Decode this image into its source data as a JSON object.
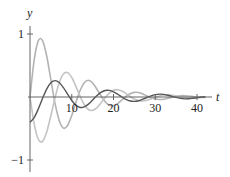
{
  "chart_data": {
    "type": "line",
    "title": "",
    "xlabel": "t",
    "ylabel": "y",
    "xlim": [
      0,
      42
    ],
    "ylim": [
      -1.05,
      1.15
    ],
    "grid": false,
    "legend": null,
    "x_ticks": [
      10,
      20,
      30,
      40
    ],
    "x_tick_labels": [
      "10",
      "20",
      "30",
      "40"
    ],
    "y_ticks": [
      1,
      -1
    ],
    "y_tick_labels": [
      "1",
      "−1"
    ],
    "x": [
      0,
      1,
      2,
      3,
      4,
      5,
      6,
      7,
      8,
      9,
      10,
      11,
      12,
      13,
      14,
      15,
      16,
      17,
      18,
      19,
      20,
      21,
      22,
      23,
      24,
      25,
      26,
      27,
      28,
      29,
      30,
      31,
      32,
      33,
      34,
      35,
      36,
      37,
      38,
      39,
      40,
      41,
      42
    ],
    "series": [
      {
        "name": "curve-light-1",
        "color": "#b3b3b3",
        "values": [
          0,
          0.586,
          0.894,
          0.896,
          0.651,
          0.275,
          -0.102,
          -0.372,
          -0.494,
          -0.452,
          -0.294,
          -0.087,
          0.104,
          0.226,
          0.265,
          0.222,
          0.128,
          0.019,
          -0.075,
          -0.131,
          -0.137,
          -0.105,
          -0.048,
          0.01,
          0.053,
          0.074,
          0.071,
          0.049,
          0.018,
          -0.012,
          -0.032,
          -0.04,
          -0.035,
          -0.021,
          -0.005,
          0.01,
          0.019,
          0.021,
          0.017,
          0.009,
          0.0,
          -0.005,
          -0.008
        ]
      },
      {
        "name": "curve-light-2",
        "color": "#c4c4c4",
        "values": [
          0,
          -0.427,
          -0.671,
          -0.704,
          -0.556,
          -0.297,
          -0.013,
          0.226,
          0.364,
          0.387,
          0.309,
          0.169,
          0.01,
          -0.12,
          -0.198,
          -0.212,
          -0.172,
          -0.096,
          -0.01,
          0.063,
          0.107,
          0.116,
          0.095,
          0.054,
          0.007,
          -0.033,
          -0.058,
          -0.064,
          -0.053,
          -0.031,
          -0.005,
          0.017,
          0.031,
          0.034,
          0.029,
          0.017,
          0.003,
          -0.009,
          -0.016,
          -0.018,
          -0.015,
          -0.009,
          -0.002
        ]
      },
      {
        "name": "curve-dark",
        "color": "#555555",
        "values": [
          -0.4,
          -0.327,
          -0.188,
          -0.023,
          0.126,
          0.226,
          0.26,
          0.229,
          0.149,
          0.045,
          -0.056,
          -0.131,
          -0.166,
          -0.157,
          -0.113,
          -0.049,
          0.019,
          0.073,
          0.103,
          0.105,
          0.083,
          0.044,
          0.0,
          -0.039,
          -0.063,
          -0.069,
          -0.059,
          -0.035,
          -0.008,
          0.019,
          0.037,
          0.045,
          0.041,
          0.027,
          0.01,
          -0.007,
          -0.021,
          -0.029,
          -0.027,
          -0.019,
          -0.01,
          0.0,
          0.005
        ]
      }
    ]
  },
  "axes": {
    "x_label": "t",
    "y_label": "y",
    "axis_color": "#555555"
  }
}
